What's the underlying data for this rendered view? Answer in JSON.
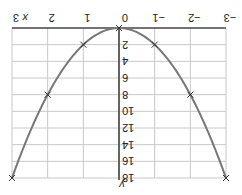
{
  "chart_data": {
    "type": "line",
    "title": "",
    "function": "y = 2x^2",
    "xlabel": "x",
    "ylabel": "y",
    "orientation": "rotated 180 degrees",
    "x": [
      -3,
      -2,
      -1,
      0,
      1,
      2,
      3
    ],
    "series": [
      {
        "name": "y = 2x²",
        "values": [
          18,
          8,
          2,
          0,
          2,
          8,
          18
        ],
        "marker": "x",
        "color": "#777777"
      }
    ],
    "xlim": [
      -3,
      3
    ],
    "ylim": [
      0,
      18
    ],
    "x_ticks": [
      "-3",
      "-2",
      "-1",
      "0",
      "1",
      "2",
      "3"
    ],
    "y_ticks": [
      "2",
      "4",
      "6",
      "8",
      "10",
      "12",
      "14",
      "16",
      "18"
    ],
    "grid": true,
    "legend": null
  },
  "colors": {
    "curve": "#777777",
    "grid": "#c8c8c8",
    "axis": "#444444",
    "text": "#222222"
  }
}
